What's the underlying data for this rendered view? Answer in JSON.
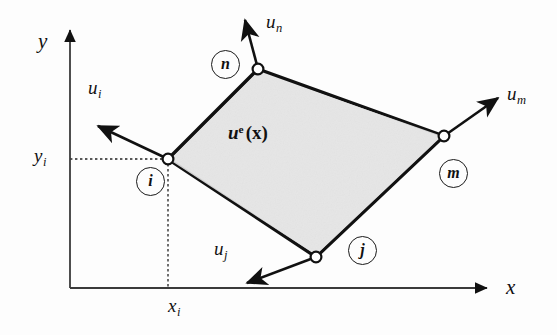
{
  "figure": {
    "background_color": "#fdfdfd",
    "element_fill_color": "#e6e6e6",
    "stroke_color": "#111111",
    "axes": {
      "x_axis_label": "x",
      "y_axis_label": "y",
      "origin_px": [
        70,
        288
      ],
      "x_axis_end_px": [
        492,
        288
      ],
      "y_axis_end_px": [
        70,
        25
      ]
    },
    "coordinates": [
      {
        "name": "x-coordinate-label",
        "label": "x",
        "subscript": "i",
        "position_px": [
          173,
          305
        ]
      },
      {
        "name": "y-coordinate-label",
        "label": "y",
        "subscript": "i",
        "position_px": [
          40,
          152
        ]
      }
    ],
    "element": {
      "label_main": "u",
      "label_superscript": "e",
      "label_arg": "(x)",
      "label_position_px": [
        258,
        133
      ],
      "vertices_px": [
        [
          168,
          159
        ],
        [
          258,
          69
        ],
        [
          444,
          136
        ],
        [
          316,
          257
        ]
      ]
    },
    "nodes": [
      {
        "id": "i",
        "name": "node-i",
        "point_px": [
          168,
          159
        ],
        "badge_center_px": [
          150,
          181
        ],
        "vector_label": "u",
        "vector_subscript": "i",
        "vector_tip_px": [
          94,
          123
        ],
        "vector_label_px": [
          93,
          88
        ]
      },
      {
        "id": "n",
        "name": "node-n",
        "point_px": [
          258,
          69
        ],
        "badge_center_px": [
          225,
          64
        ],
        "vector_label": "u",
        "vector_subscript": "n",
        "vector_tip_px": [
          243,
          16
        ],
        "vector_label_px": [
          268,
          20
        ]
      },
      {
        "id": "m",
        "name": "node-m",
        "point_px": [
          444,
          136
        ],
        "badge_center_px": [
          453,
          173
        ],
        "vector_label": "u",
        "vector_subscript": "m",
        "vector_tip_px": [
          501,
          95
        ],
        "vector_label_px": [
          510,
          92
        ]
      },
      {
        "id": "j",
        "name": "node-j",
        "point_px": [
          316,
          257
        ],
        "badge_center_px": [
          362,
          250
        ],
        "vector_label": "u",
        "vector_subscript": "j",
        "vector_tip_px": [
          242,
          285
        ],
        "vector_label_px": [
          219,
          248
        ]
      }
    ],
    "guides": [
      {
        "name": "horizontal-guide-yi",
        "from_px": [
          70,
          159
        ],
        "to_px": [
          168,
          159
        ]
      },
      {
        "name": "vertical-guide-xi",
        "from_px": [
          168,
          159
        ],
        "to_px": [
          168,
          288
        ]
      }
    ]
  }
}
